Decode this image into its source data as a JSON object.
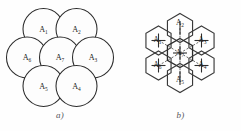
{
  "figure": {
    "panels": [
      {
        "id": "a",
        "caption": "a)",
        "kind": "circles",
        "description": "Seven overlapping circles arranged in hexagonal close packing",
        "cells": [
          {
            "id": "A1",
            "base": "A",
            "sub": "1",
            "cx": 43.5,
            "cy": 29.0,
            "r": 20.5
          },
          {
            "id": "A2",
            "base": "A",
            "sub": "2",
            "cx": 76.5,
            "cy": 29.0,
            "r": 20.5
          },
          {
            "id": "A6",
            "base": "A",
            "sub": "6",
            "cx": 27.0,
            "cy": 57.5,
            "r": 20.5
          },
          {
            "id": "A7",
            "base": "A",
            "sub": "7",
            "cx": 60.0,
            "cy": 57.5,
            "r": 20.5
          },
          {
            "id": "A3",
            "base": "A",
            "sub": "3",
            "cx": 93.0,
            "cy": 57.5,
            "r": 20.5
          },
          {
            "id": "A5",
            "base": "A",
            "sub": "5",
            "cx": 43.5,
            "cy": 86.0,
            "r": 20.5
          },
          {
            "id": "A4",
            "base": "A",
            "sub": "4",
            "cx": 76.5,
            "cy": 86.0,
            "r": 20.5
          }
        ]
      },
      {
        "id": "b",
        "caption": "b)",
        "kind": "hexagons",
        "description": "Seven tessellating hexagonal cells with dashed lines joining cell centres",
        "cells": [
          {
            "id": "A2",
            "base": "A",
            "sub": "2",
            "cx": 60.0,
            "cy": 28.0,
            "label_dx": 0.0,
            "label_dy": -3.5
          },
          {
            "id": "A1",
            "base": "A",
            "sub": "1",
            "cx": 38.5,
            "cy": 40.5,
            "label_dx": -1.0,
            "label_dy": 1.5
          },
          {
            "id": "A3",
            "base": "A",
            "sub": "3",
            "cx": 81.5,
            "cy": 40.5,
            "label_dx": 1.0,
            "label_dy": 1.5
          },
          {
            "id": "A7",
            "base": "A",
            "sub": "7",
            "cx": 60.0,
            "cy": 53.0,
            "label_dx": 0.0,
            "label_dy": 1.5
          },
          {
            "id": "A6",
            "base": "A",
            "sub": "6",
            "cx": 38.5,
            "cy": 65.5,
            "label_dx": -1.0,
            "label_dy": 1.5
          },
          {
            "id": "A4",
            "base": "A",
            "sub": "4",
            "cx": 81.5,
            "cy": 65.5,
            "label_dx": 1.0,
            "label_dy": 1.5
          },
          {
            "id": "A5",
            "base": "A",
            "sub": "5",
            "cx": 60.0,
            "cy": 78.0,
            "label_dx": 0.0,
            "label_dy": 4.0
          }
        ],
        "hex_radius": 14.5
      }
    ]
  }
}
